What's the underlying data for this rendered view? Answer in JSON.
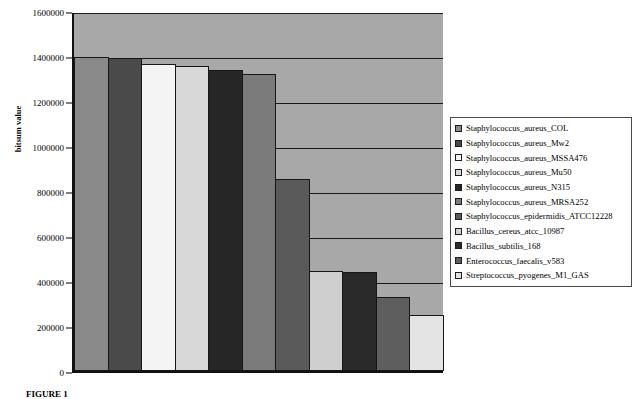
{
  "chart_data": {
    "type": "bar",
    "title": "",
    "xlabel": "",
    "ylabel": "bitsum value",
    "ylim": [
      0,
      1600000
    ],
    "ytick_step": 200000,
    "yticks": [
      0,
      200000,
      400000,
      600000,
      800000,
      1000000,
      1200000,
      1400000,
      1600000
    ],
    "ytick_labels": [
      "0",
      "200000",
      "400000",
      "600000",
      "800000",
      "1000000",
      "1200000",
      "1400000",
      "1600000"
    ],
    "grid": true,
    "legend_position": "right",
    "plot_background": "#a8a8a8",
    "categories": [
      "Staphylococcus_aureus_COL",
      "Staphylococcus_aureus_Mw2",
      "Staphylococcus_aureus_MSSA476",
      "Staphylococcus_aureus_Mu50",
      "Staphylococcus_aureus_N315",
      "Staphylococcus_aureus_MRSA252",
      "Staphylococcus_epidermidis_ATCC12228",
      "Bacillus_cereus_atcc_10987",
      "Bacillus_subtilis_168",
      "Enterococcus_faecalis_v583",
      "Streptococcus_pyogenes_M1_GAS"
    ],
    "values": [
      1405000,
      1398000,
      1370000,
      1362000,
      1345000,
      1328000,
      860000,
      445000,
      443000,
      332000,
      252000
    ],
    "colors": [
      "#8a8a8a",
      "#4a4a4a",
      "#f4f4f4",
      "#d8d8d8",
      "#262626",
      "#7b7b7b",
      "#5a5a5a",
      "#cfcfcf",
      "#2a2a2a",
      "#5e5e5e",
      "#e4e4e4"
    ]
  },
  "legend": {
    "items": [
      {
        "label": "Staphylococcus_aureus_COL",
        "color": "#8a8a8a"
      },
      {
        "label": "Staphylococcus_aureus_Mw2",
        "color": "#4a4a4a"
      },
      {
        "label": "Staphylococcus_aureus_MSSA476",
        "color": "#f4f4f4"
      },
      {
        "label": "Staphylococcus_aureus_Mu50",
        "color": "#d8d8d8"
      },
      {
        "label": "Staphylococcus_aureus_N315",
        "color": "#262626"
      },
      {
        "label": "Staphylococcus_aureus_MRSA252",
        "color": "#7b7b7b"
      },
      {
        "label": "Staphylococcus_epidermidis_ATCC12228",
        "color": "#5a5a5a"
      },
      {
        "label": "Bacillus_cereus_atcc_10987",
        "color": "#cfcfcf"
      },
      {
        "label": "Bacillus_subtilis_168",
        "color": "#2a2a2a"
      },
      {
        "label": "Enterococcus_faecalis_v583",
        "color": "#5e5e5e"
      },
      {
        "label": "Streptococcus_pyogenes_M1_GAS",
        "color": "#e4e4e4"
      }
    ]
  },
  "caption": {
    "text": "FIGURE 1"
  }
}
